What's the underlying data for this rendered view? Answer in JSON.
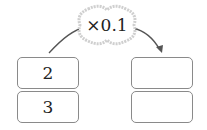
{
  "operation": {
    "label": "×0.1",
    "shape": "cloud-bubble",
    "arrow": "curved-arrow-left-to-right"
  },
  "left_column": {
    "values": [
      "2",
      "3"
    ]
  },
  "right_column": {
    "values": [
      "",
      ""
    ]
  },
  "colors": {
    "stroke": "#8a8a8a",
    "arrow": "#555555",
    "cloud_border": "#c8c8c8",
    "text": "#222222"
  }
}
